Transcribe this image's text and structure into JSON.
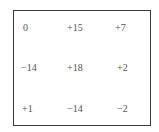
{
  "grid": {
    "rows": [
      [
        "0",
        "+15",
        "+7"
      ],
      [
        "−14",
        "+18",
        "+2"
      ],
      [
        "+1",
        "−14",
        "−2"
      ]
    ]
  }
}
